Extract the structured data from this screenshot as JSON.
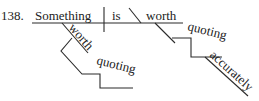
{
  "diagram": {
    "type": "sentence-diagram",
    "number": "138.",
    "sentence": "Something is worth quoting accurately / worth quoting",
    "words": {
      "subject": "Something",
      "verb": "is",
      "complement": "worth",
      "complement_object": "quoting",
      "complement_object_modifier": "accurately",
      "subject_modifier": "worth",
      "subject_modifier_object": "quoting"
    },
    "colors": {
      "line": "#2a2a2a",
      "text": "#222222",
      "background": "#ffffff"
    }
  }
}
